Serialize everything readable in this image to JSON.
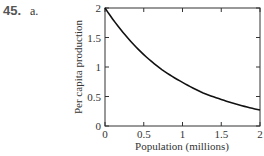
{
  "problem": {
    "number": "45.",
    "part": "a."
  },
  "chart_data": {
    "type": "line",
    "title": "",
    "xlabel": "Population (millions)",
    "ylabel": "Per capita production",
    "xlim": [
      0,
      2
    ],
    "ylim": [
      0,
      2
    ],
    "xticks": [
      "0",
      "0.5",
      "1",
      "1.5",
      "2"
    ],
    "yticks": [
      "0",
      "0.5",
      "1",
      "1.5",
      "2"
    ],
    "grid": false,
    "legend": null,
    "series": [
      {
        "name": "per capita production",
        "x": [
          0,
          0.25,
          0.5,
          0.75,
          1,
          1.25,
          1.5,
          1.75,
          2
        ],
        "y": [
          2.0,
          1.56,
          1.21,
          0.94,
          0.74,
          0.57,
          0.45,
          0.35,
          0.27
        ]
      }
    ]
  }
}
